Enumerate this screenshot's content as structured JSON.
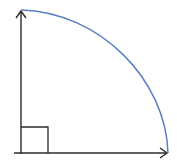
{
  "diagram": {
    "type": "quarter-circle-sector",
    "width": 177,
    "height": 166,
    "colors": {
      "background": "#ffffff",
      "axis": "#2b2b2b",
      "arc": "#5b7fc4",
      "right_angle_marker": "#2b2b2b"
    },
    "origin": [
      21,
      153
    ],
    "vertical_axis_end": [
      21,
      10
    ],
    "horizontal_axis_end": [
      168,
      153
    ],
    "arc": {
      "start": [
        21,
        10
      ],
      "end": [
        168,
        153
      ]
    },
    "right_angle_marker": {
      "x": 21,
      "y": 127,
      "size": 27
    }
  }
}
